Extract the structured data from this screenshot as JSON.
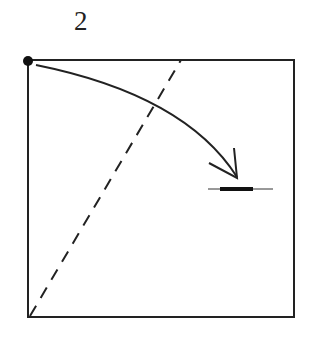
{
  "diagram": {
    "step_number": "2",
    "type": "origami-fold-step",
    "elements": {
      "paper": "square",
      "fold_line": "valley-fold (dashed)",
      "arrow": "fold corner to mark",
      "reference_point": "top-left corner dot",
      "landmark": "horizontal crease mark on right"
    },
    "colors": {
      "ink": "#222222",
      "background": "#ffffff"
    }
  }
}
